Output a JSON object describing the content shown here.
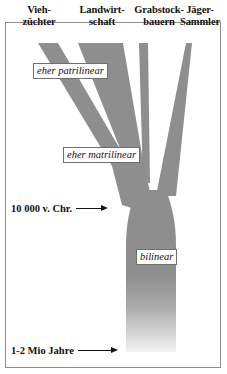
{
  "figure": {
    "colors": {
      "branch_fill": "#8e8e8e",
      "trunk_fill_top": "#8e8e8e",
      "trunk_fill_bottom": "#eeeeee",
      "frame_border": "#8d8d8d",
      "text": "#15120f",
      "tag_background": "#ffffff",
      "tag_border": "#6f6f6f",
      "background": "#ffffff"
    }
  },
  "columns": [
    {
      "id": "viehzuechter",
      "line1": "Vieh-",
      "line2": "züchter"
    },
    {
      "id": "landwirtschaft",
      "line1": "Landwirt-",
      "line2": "schaft"
    },
    {
      "id": "grabstockbauern",
      "line1": "Grabstock-",
      "line2": "bauern"
    },
    {
      "id": "jaeger_sammler",
      "line1": "Jäger-",
      "line2": "Sammler"
    }
  ],
  "tags": [
    {
      "id": "patrilinear",
      "text": "eher patrilinear"
    },
    {
      "id": "matrilinear",
      "text": "eher matrilinear"
    },
    {
      "id": "bilinear",
      "text": "bilinear"
    }
  ],
  "axis_notes": [
    {
      "id": "note_10000",
      "text": "10 000 v. Chr."
    },
    {
      "id": "note_mio",
      "text": "1-2 Mio Jahre"
    }
  ]
}
